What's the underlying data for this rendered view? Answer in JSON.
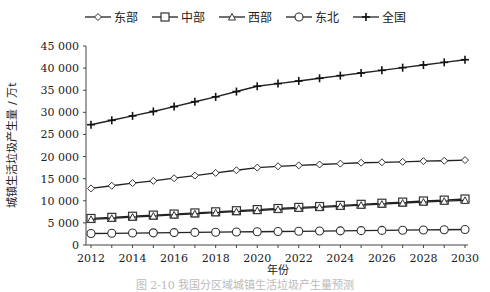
{
  "chart_data": {
    "type": "line",
    "title": "",
    "xlabel": "年份",
    "ylabel": "城镇生活垃圾产生量 / 万t",
    "x": [
      2012,
      2013,
      2014,
      2015,
      2016,
      2017,
      2018,
      2019,
      2020,
      2021,
      2022,
      2023,
      2024,
      2025,
      2026,
      2027,
      2028,
      2029,
      2030
    ],
    "xticks": [
      "2012",
      "2014",
      "2016",
      "2018",
      "2020",
      "2022",
      "2024",
      "2026",
      "2028",
      "2030"
    ],
    "yticks": [
      "0",
      "5 000",
      "10 000",
      "15 000",
      "20 000",
      "25 000",
      "30 000",
      "35 000",
      "40 000",
      "45 000"
    ],
    "ylim": [
      0,
      45000
    ],
    "grid": false,
    "legend_position": "top",
    "series": [
      {
        "name": "东部",
        "marker": "diamond",
        "values": [
          12800,
          13400,
          14000,
          14500,
          15100,
          15700,
          16300,
          16900,
          17500,
          17800,
          18000,
          18200,
          18400,
          18600,
          18700,
          18800,
          18950,
          19050,
          19200
        ]
      },
      {
        "name": "中部",
        "marker": "square",
        "values": [
          6000,
          6250,
          6500,
          6750,
          7000,
          7250,
          7500,
          7750,
          8000,
          8250,
          8500,
          8700,
          8950,
          9200,
          9450,
          9700,
          9950,
          10150,
          10400
        ]
      },
      {
        "name": "西部",
        "marker": "triangle",
        "values": [
          5800,
          6050,
          6300,
          6550,
          6800,
          7050,
          7300,
          7550,
          7800,
          8050,
          8300,
          8500,
          8750,
          9000,
          9250,
          9500,
          9700,
          9900,
          10100
        ]
      },
      {
        "name": "东北",
        "marker": "circle",
        "values": [
          2600,
          2650,
          2700,
          2750,
          2800,
          2850,
          2900,
          2950,
          3000,
          3050,
          3100,
          3150,
          3200,
          3250,
          3300,
          3350,
          3400,
          3450,
          3500
        ]
      },
      {
        "name": "全国",
        "marker": "plus",
        "values": [
          27200,
          28200,
          29200,
          30200,
          31300,
          32400,
          33500,
          34700,
          35900,
          36500,
          37100,
          37700,
          38300,
          38900,
          39500,
          40100,
          40700,
          41300,
          41900
        ]
      }
    ]
  },
  "caption": "图 2-10 我国分区域城镇生活垃圾产生量预测"
}
